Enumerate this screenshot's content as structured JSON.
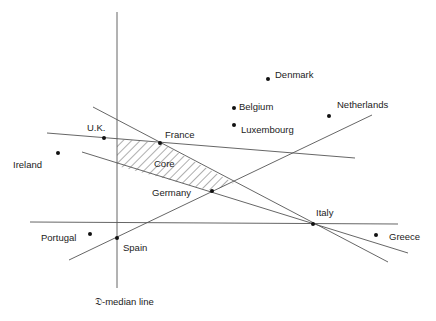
{
  "diagram": {
    "axis_label": "𝔇-median line",
    "core_label": "Core",
    "countries": [
      {
        "name": "Denmark",
        "x": 268,
        "y": 79
      },
      {
        "name": "Belgium",
        "x": 234,
        "y": 108
      },
      {
        "name": "Luxembourg",
        "x": 234,
        "y": 125
      },
      {
        "name": "Netherlands",
        "x": 329,
        "y": 116
      },
      {
        "name": "U.K.",
        "x": 104,
        "y": 137
      },
      {
        "name": "France",
        "x": 160,
        "y": 143
      },
      {
        "name": "Ireland",
        "x": 58,
        "y": 153
      },
      {
        "name": "Germany",
        "x": 212,
        "y": 191
      },
      {
        "name": "Italy",
        "x": 313,
        "y": 224
      },
      {
        "name": "Portugal",
        "x": 90,
        "y": 234
      },
      {
        "name": "Spain",
        "x": 117,
        "y": 238
      },
      {
        "name": "Greece",
        "x": 376,
        "y": 235
      }
    ]
  }
}
